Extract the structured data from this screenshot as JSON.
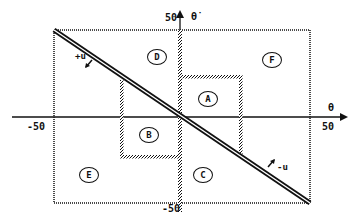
{
  "diagram": {
    "axes": {
      "x_label": "θ",
      "y_label": "θ̇",
      "x_min_label": "-50",
      "x_max_label": "50",
      "y_min_label": "-50",
      "y_max_label": "50"
    },
    "regions": [
      {
        "id": "A",
        "label": "A"
      },
      {
        "id": "B",
        "label": "B"
      },
      {
        "id": "C",
        "label": "C"
      },
      {
        "id": "D",
        "label": "D"
      },
      {
        "id": "E",
        "label": "E"
      },
      {
        "id": "F",
        "label": "F"
      }
    ],
    "switching_line": {
      "upper_label": "+u",
      "lower_label": "-u"
    },
    "colors": {
      "ink": "#111111",
      "background": "#ffffff"
    }
  }
}
